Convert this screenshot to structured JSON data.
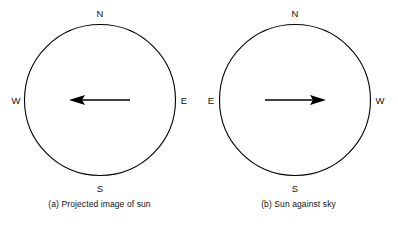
{
  "figure": {
    "background_color": "#ffffff",
    "stroke_color": "#000000",
    "panels": [
      {
        "id": "a",
        "caption": "(a) Projected image of sun",
        "compass": {
          "north": "N",
          "south": "S",
          "left": "W",
          "right": "E"
        },
        "arrow": {
          "direction": "left",
          "points_toward": "W"
        }
      },
      {
        "id": "b",
        "caption": "(b) Sun against sky",
        "compass": {
          "north": "N",
          "south": "S",
          "left": "E",
          "right": "W"
        },
        "arrow": {
          "direction": "right",
          "points_toward": "W"
        }
      }
    ]
  }
}
